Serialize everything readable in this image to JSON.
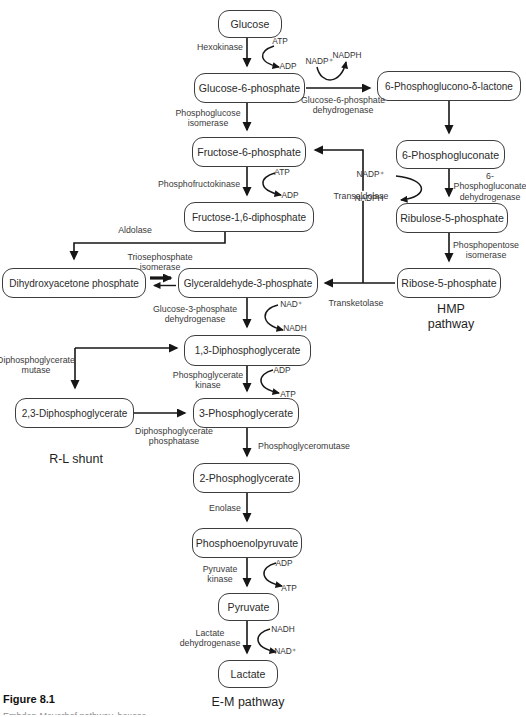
{
  "figure": {
    "number": "Figure 8.1",
    "caption_clipped": "Embden-Meyerhof pathway, hexose monophosphate pathway, and Rapoport-Luebering shunt."
  },
  "pathways": {
    "hmp": "HMP pathway",
    "rl_shunt": "R-L shunt",
    "em": "E-M pathway"
  },
  "metabolites": {
    "glucose": "Glucose",
    "glucose_6_phosphate": "Glucose-6-phosphate",
    "phosphoglucono_lactone": "6-Phosphoglucono-δ-lactone",
    "fructose_6_phosphate": "Fructose-6-phosphate",
    "phosphogluconate_6": "6-Phosphogluconate",
    "fructose_16_diphosphate": "Fructose-1,6-diphosphate",
    "ribulose_5_phosphate": "Ribulose-5-phosphate",
    "dihydroxyacetone_phosphate": "Dihydroxyacetone phosphate",
    "glyceraldehyde_3_phosphate": "Glyceraldehyde-3-phosphate",
    "ribose_5_phosphate": "Ribose-5-phosphate",
    "diphosphoglycerate_13": "1,3-Diphosphoglycerate",
    "diphosphoglycerate_23": "2,3-Diphosphoglycerate",
    "phosphoglycerate_3": "3-Phosphoglycerate",
    "phosphoglycerate_2": "2-Phosphoglycerate",
    "phosphoenolpyruvate": "Phosphoenolpyruvate",
    "pyruvate": "Pyruvate",
    "lactate": "Lactate"
  },
  "enzymes": {
    "hexokinase": "Hexokinase",
    "phosphoglucose_isomerase": "Phosphoglucose\nisomerase",
    "g6p_dehydrogenase": "Glucose-6-phosphate\ndehydrogenase",
    "phosphofructokinase": "Phosphofructokinase",
    "aldolase": "Aldolase",
    "triosephosphate_isomerase": "Triosephosphate\nisomerase",
    "transaldolase": "Transaldolase",
    "transketolase": "Transketolase",
    "phosphogluconate_dehydrogenase": "6-Phosphogluconate\ndehydrogenase",
    "phosphopentose_isomerase": "Phosphopentose\nisomerase",
    "g3p_dehydrogenase": "Glucose-3-phosphate\ndehydrogenase",
    "phosphoglycerate_kinase": "Phosphoglycerate\nkinase",
    "diphosphoglycerate_mutase": "Diphosphoglycerate\nmutase",
    "diphosphoglycerate_phosphatase": "Diphosphoglycerate\nphosphatase",
    "phosphoglyceromutase": "Phosphoglyceromutase",
    "enolase": "Enolase",
    "pyruvate_kinase": "Pyruvate\nkinase",
    "lactate_dehydrogenase": "Lactate\ndehydrogenase"
  },
  "cofactors": {
    "hexokinase_in": "ATP",
    "hexokinase_out": "ADP",
    "g6pd_in": "NADP⁺",
    "g6pd_out": "NADPH",
    "pfk_in": "ATP",
    "pfk_out": "ADP",
    "pgd_in": "NADP⁺",
    "pgd_out": "NADPH",
    "gapdh_in": "NAD⁺",
    "gapdh_out": "NADH",
    "pgk_in": "ADP",
    "pgk_out": "ATP",
    "pk_in": "ADP",
    "pk_out": "ATP",
    "ldh_in": "NADH",
    "ldh_out": "NAD⁺"
  }
}
